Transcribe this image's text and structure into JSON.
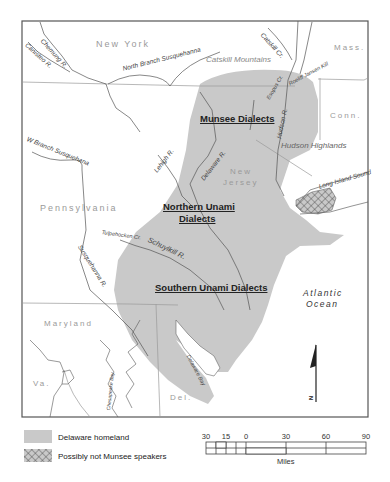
{
  "map": {
    "colors": {
      "homeland": "#c9c9c9",
      "frame": "#555555",
      "rivers": "#555555",
      "boundaries": "#9a9a9a",
      "background": "#ffffff"
    },
    "states": {
      "new_york": "New York",
      "mass": "Mass.",
      "conn": "Conn.",
      "new_jersey_line1": "New",
      "new_jersey_line2": "Jersey",
      "pennsylvania": "Pennsylvania",
      "maryland": "Maryland",
      "virginia": "Va.",
      "delaware": "Del."
    },
    "rivers": {
      "chemung": "Chemung R.",
      "canisteo": "Canisteo R.",
      "north_branch": "North Branch Susquehanna",
      "catskill_cr": "Catskill Cr.",
      "esopus_cr": "Esopus Cr.",
      "roeliff": "Roeliff Jansen Kill",
      "hudson": "Hudson R.",
      "west_branch": "W Branch Susquehana",
      "lehigh": "Lehigh R.",
      "delaware": "Delaware R.",
      "tulpehocken": "Tulpehocken Cr.",
      "schuylkill": "Schuylkill R.",
      "susquehanna": "Susquehanna R.",
      "chesapeake": "Chesapeake Bay",
      "delaware_bay": "Delaware Bay",
      "long_island_sound": "Long Island Sound"
    },
    "regions": {
      "catskill_mountains": "Catskill Mountains",
      "hudson_highlands": "Hudson Highlands"
    },
    "dialects": {
      "munsee": "Munsee Dialects",
      "northern_unami_line1": "Northern Unami",
      "northern_unami_line2": "Dialects",
      "southern_unami": "Southern Unami Dialects"
    },
    "ocean": {
      "line1": "Atlantic",
      "line2": "Ocean"
    },
    "north_arrow": "N"
  },
  "legend": {
    "items": [
      {
        "label": "Delaware homeland",
        "pattern": "solid-gray"
      },
      {
        "label": "Possibly not Munsee speakers",
        "pattern": "crosshatch"
      }
    ]
  },
  "scale_bar": {
    "ticks": [
      "30",
      "15",
      "0",
      "30",
      "60",
      "90"
    ],
    "unit": "Miles"
  }
}
